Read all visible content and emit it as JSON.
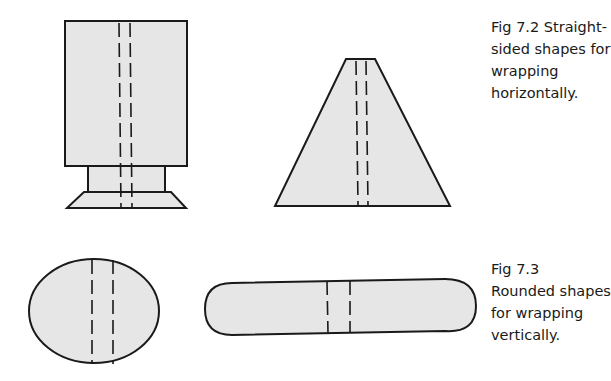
{
  "figures": [
    {
      "id": "fig-7-2",
      "caption_lines": [
        "Fig 7.2  Straight-",
        "sided shapes for",
        "wrapping",
        "horizontally."
      ],
      "shapes": [
        "tall rectangle on pedestal",
        "trapezoid"
      ]
    },
    {
      "id": "fig-7-3",
      "caption_lines": [
        "Fig 7.3",
        "Rounded shapes",
        "for wrapping",
        "vertically."
      ],
      "shapes": [
        "ellipse",
        "capsule"
      ]
    }
  ],
  "colors": {
    "fill": "#e6e6e6",
    "stroke": "#1a1a1a",
    "background": "#ffffff"
  }
}
